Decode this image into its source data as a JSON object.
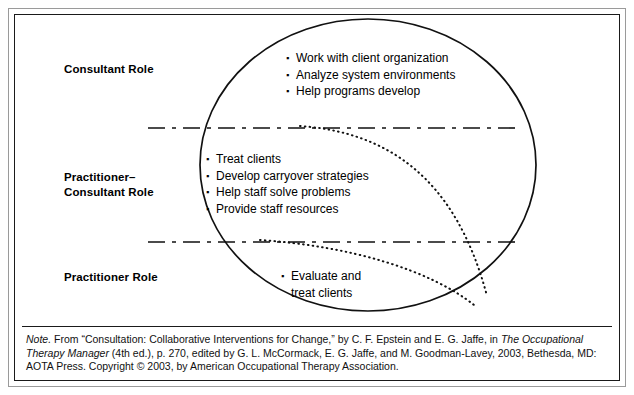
{
  "figure": {
    "roles": [
      {
        "id": "consultant",
        "label": "Consultant Role"
      },
      {
        "id": "practitioner-consultant",
        "label": "Practitioner–\nConsultant Role"
      },
      {
        "id": "practitioner",
        "label": "Practitioner Role"
      }
    ],
    "bullet_groups": [
      {
        "id": "consultant-tasks",
        "items": [
          "Work with client organization",
          "Analyze system environments",
          "Help programs develop"
        ]
      },
      {
        "id": "practitioner-consultant-tasks",
        "items": [
          "Treat clients",
          "Develop carryover strategies",
          "Help staff solve problems",
          "Provide staff resources"
        ]
      },
      {
        "id": "practitioner-tasks",
        "items": [
          "Evaluate and\ntreat clients"
        ]
      }
    ],
    "bullet_marker": "▪",
    "colors": {
      "ink": "#000000",
      "frame": "#1a1a1a",
      "outer_frame": "#9a9a9a",
      "background": "#ffffff"
    }
  },
  "note": {
    "label": "Note.",
    "line1_a": " From “Consultation: Collaborative Interventions for Change,” by C. F. Epstein and E. G. Jaffe, in ",
    "source_italic": "The Occupational Therapy",
    "line2_italic": "Manager",
    "line2_b": " (4th ed.), p. 270, edited by G. L. McCormack, E. G. Jaffe, and M. Goodman-Lavey, 2003, Bethesda, MD: AOTA Press.",
    "line3": "Copyright © 2003, by American Occupational Therapy Association."
  }
}
